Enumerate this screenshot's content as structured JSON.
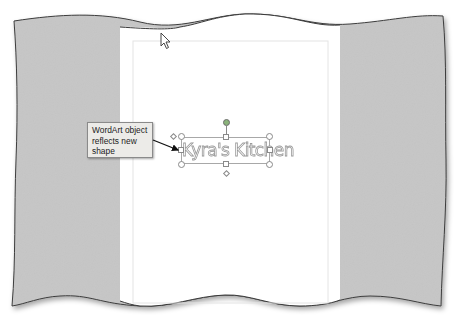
{
  "callout": {
    "text": "WordArt object reflects new shape",
    "line1": "WordArt object",
    "line2": "reflects new",
    "line3": "shape"
  },
  "wordart": {
    "text": "Kyra's Kitchen",
    "selected": true
  },
  "cursor": {
    "icon": "pointer-arrow-icon"
  },
  "colors": {
    "background_gray": "#c4c4c4",
    "page": "#ffffff",
    "callout_bg": "#ecebe8",
    "handle_rotate": "#8ab37a",
    "outline": "#555555"
  }
}
